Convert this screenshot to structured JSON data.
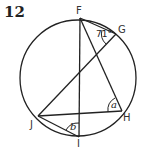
{
  "question_number": "12",
  "points": {
    "F": {
      "label": "F",
      "x": 80,
      "y": 18
    },
    "G": {
      "label": "G",
      "x": 116,
      "y": 34
    },
    "H": {
      "label": "H",
      "x": 122,
      "y": 111
    },
    "I": {
      "label": "I",
      "x": 79,
      "y": 137
    },
    "J": {
      "label": "J",
      "x": 38,
      "y": 116
    }
  },
  "circle": {
    "cx": 78,
    "cy": 78,
    "r": 58
  },
  "angles": {
    "FGJ_value": "71°",
    "at_H": "a",
    "at_I": "b"
  },
  "segments": [
    "FG",
    "FI",
    "FH",
    "GJ",
    "JH",
    "JI"
  ]
}
